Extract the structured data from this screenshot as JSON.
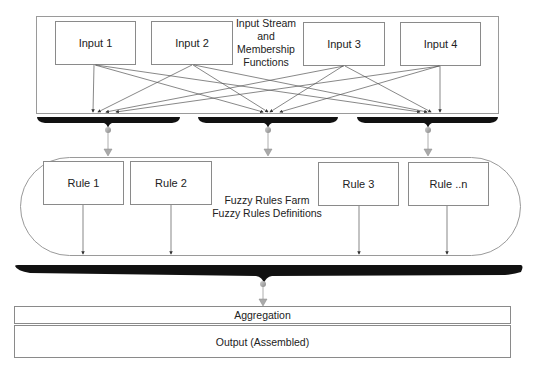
{
  "input_stage": {
    "title_lines": [
      "Input Stream",
      "and",
      "Membership",
      "Functions"
    ],
    "inputs": [
      {
        "label": "Input 1"
      },
      {
        "label": "Input 2"
      },
      {
        "label": "Input 3"
      },
      {
        "label": "Input 4"
      }
    ]
  },
  "rules_stage": {
    "title_lines": [
      "Fuzzy Rules Farm",
      "Fuzzy Rules Definitions"
    ],
    "rules": [
      {
        "label": "Rule 1"
      },
      {
        "label": "Rule 2"
      },
      {
        "label": "Rule 3"
      },
      {
        "label": "Rule ..n"
      }
    ]
  },
  "aggregation": {
    "label": "Aggregation"
  },
  "output": {
    "label": "Output (Assembled)"
  },
  "colors": {
    "border": "#8a8a8a",
    "bar": "#111111",
    "connector": "#9a9a9a"
  }
}
